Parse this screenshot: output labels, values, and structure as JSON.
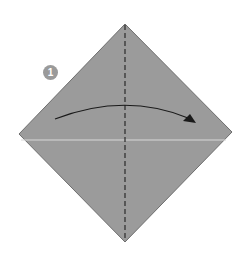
{
  "diagram": {
    "step_number": "1",
    "colors": {
      "paper": "#9b9b9b",
      "paper_edge": "#6e6e6e",
      "fold_line": "#2a2a2a",
      "arrow": "#1a1a1a",
      "crease": "#d8d8d8",
      "step_badge": "#9a9a9a"
    },
    "shape": {
      "top": [
        125,
        24
      ],
      "right": [
        232,
        132
      ],
      "bottom": [
        125,
        242
      ],
      "left": [
        19,
        134
      ]
    },
    "valley_fold": {
      "x": 125,
      "y1": 24,
      "y2": 242,
      "style": "dashed"
    },
    "crease_line": {
      "y": 140
    },
    "arrow": {
      "from": [
        55,
        119
      ],
      "control": [
        125,
        92
      ],
      "to": [
        195,
        122
      ],
      "direction": "right"
    }
  }
}
